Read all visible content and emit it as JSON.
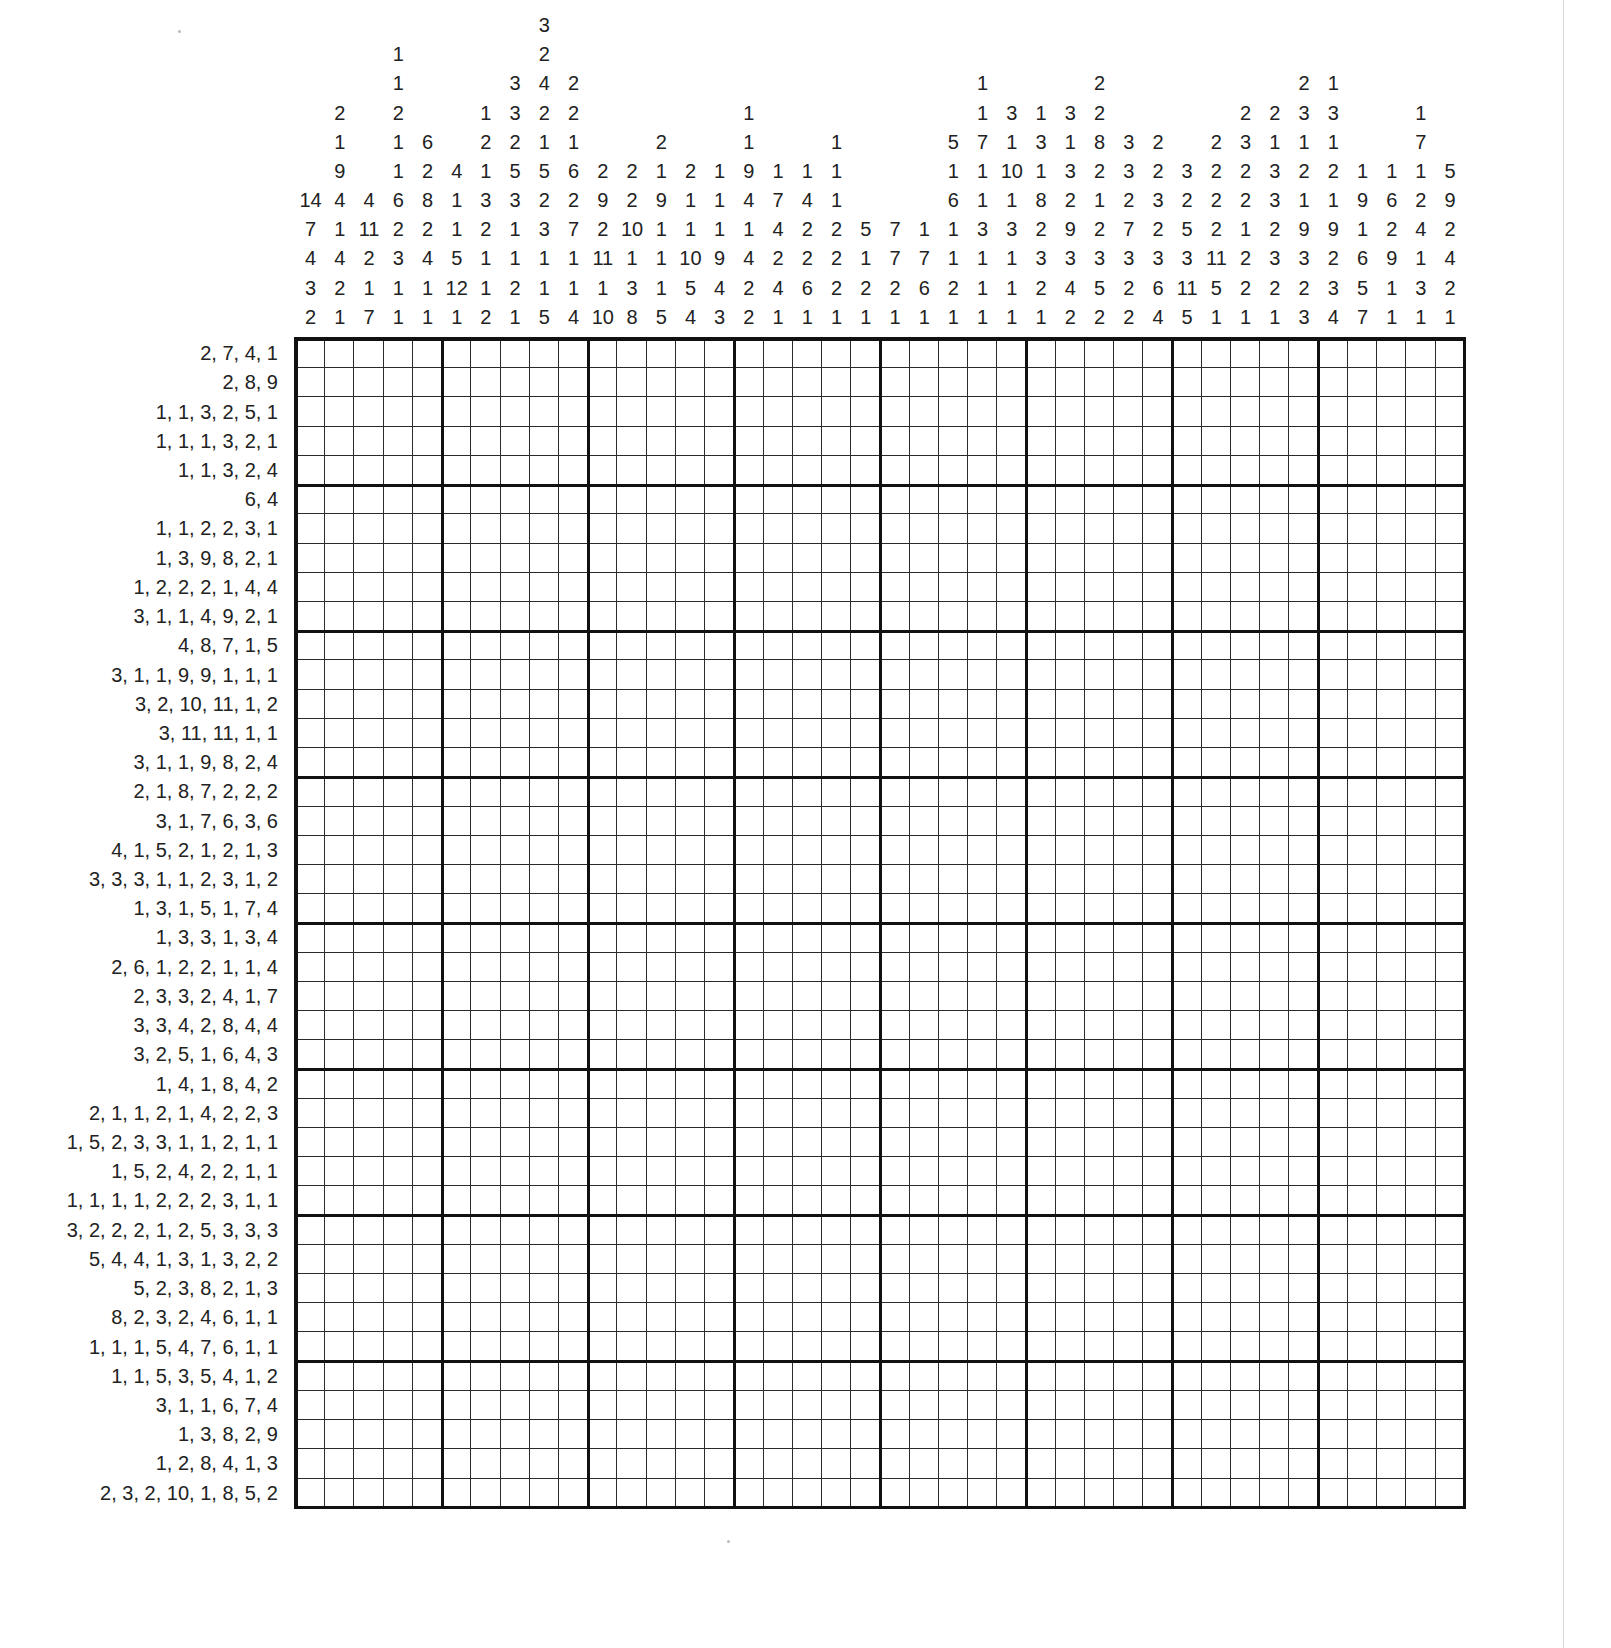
{
  "puzzle": {
    "type": "nonogram",
    "grid_width": 40,
    "grid_height": 40,
    "block_size": 5,
    "grid_color": "#2b2b2b",
    "thick_line_color": "#111111",
    "background_color": "#ffffff",
    "text_color": "#222222"
  },
  "column_clues": [
    [
      14,
      7,
      4,
      3,
      2
    ],
    [
      2,
      1,
      9,
      4,
      1,
      4,
      2,
      1
    ],
    [
      4,
      11,
      2,
      1,
      7
    ],
    [
      1,
      1,
      2,
      1,
      1,
      6,
      2,
      3,
      1,
      1
    ],
    [
      6,
      2,
      8,
      2,
      4,
      1,
      1
    ],
    [
      4,
      1,
      1,
      5,
      12,
      1
    ],
    [
      1,
      2,
      1,
      3,
      2,
      1,
      1,
      2
    ],
    [
      3,
      3,
      2,
      5,
      3,
      1,
      1,
      2,
      1
    ],
    [
      3,
      2,
      4,
      2,
      1,
      5,
      2,
      3,
      1,
      1,
      5
    ],
    [
      2,
      2,
      1,
      6,
      2,
      7,
      1,
      1,
      4
    ],
    [
      2,
      9,
      2,
      11,
      1,
      10
    ],
    [
      2,
      2,
      10,
      1,
      3,
      8
    ],
    [
      2,
      1,
      9,
      1,
      1,
      1,
      5
    ],
    [
      2,
      1,
      1,
      10,
      5,
      4
    ],
    [
      1,
      1,
      1,
      9,
      4,
      3
    ],
    [
      1,
      1,
      9,
      4,
      1,
      4,
      2,
      2
    ],
    [
      1,
      7,
      4,
      2,
      4,
      1
    ],
    [
      1,
      4,
      2,
      2,
      6,
      1
    ],
    [
      1,
      1,
      1,
      2,
      2,
      2,
      1
    ],
    [
      5,
      1,
      2,
      1
    ],
    [
      7,
      7,
      2,
      1
    ],
    [
      1,
      7,
      6,
      1
    ],
    [
      5,
      1,
      6,
      1,
      1,
      2,
      1
    ],
    [
      1,
      1,
      7,
      1,
      1,
      3,
      1,
      1,
      1
    ],
    [
      3,
      1,
      10,
      1,
      3,
      1,
      1,
      1
    ],
    [
      1,
      3,
      1,
      8,
      2,
      3,
      2,
      1
    ],
    [
      3,
      1,
      3,
      2,
      9,
      3,
      4,
      2
    ],
    [
      2,
      2,
      8,
      2,
      1,
      2,
      3,
      5,
      2
    ],
    [
      3,
      3,
      2,
      7,
      3,
      2,
      2
    ],
    [
      2,
      2,
      3,
      2,
      3,
      6,
      4
    ],
    [
      3,
      2,
      5,
      3,
      11,
      5
    ],
    [
      2,
      2,
      2,
      2,
      11,
      5,
      1
    ],
    [
      2,
      3,
      2,
      2,
      1,
      2,
      2,
      1
    ],
    [
      2,
      1,
      3,
      3,
      2,
      3,
      2,
      1
    ],
    [
      2,
      3,
      1,
      2,
      1,
      9,
      3,
      2,
      3
    ],
    [
      1,
      3,
      1,
      2,
      1,
      9,
      2,
      3,
      4
    ],
    [
      1,
      9,
      1,
      6,
      5,
      7
    ],
    [
      1,
      6,
      2,
      9,
      1,
      1
    ],
    [
      1,
      7,
      1,
      2,
      4,
      1,
      3,
      1
    ],
    [
      5,
      9,
      2,
      4,
      2,
      1
    ]
  ],
  "row_clues": [
    "2, 7, 4, 1",
    "2, 8, 9",
    "1, 1, 3, 2, 5, 1",
    "1, 1, 1, 3, 2, 1",
    "1, 1, 3, 2, 4",
    "6, 4",
    "1, 1, 2, 2, 3, 1",
    "1, 3, 9, 8, 2, 1",
    "1, 2, 2, 2, 1, 4, 4",
    "3, 1, 1, 4, 9, 2, 1",
    "4, 8, 7, 1, 5",
    "3, 1, 1, 9, 9, 1, 1, 1",
    "3, 2, 10, 11, 1, 2",
    "3, 11, 11, 1, 1",
    "3, 1, 1, 9, 8, 2, 4",
    "2, 1, 8, 7, 2, 2, 2",
    "3, 1, 7, 6, 3, 6",
    "4, 1, 5, 2, 1, 2, 1, 3",
    "3, 3, 3, 1, 1, 2, 3, 1, 2",
    "1, 3, 1, 5, 1, 7, 4",
    "1, 3, 3, 1, 3, 4",
    "2, 6, 1, 2, 2, 1, 1, 4",
    "2, 3, 3, 2, 4, 1, 7",
    "3, 3, 4, 2, 8, 4, 4",
    "3, 2, 5, 1, 6, 4, 3",
    "1, 4, 1, 8, 4, 2",
    "2, 1, 1, 2, 1, 4, 2, 2, 3",
    "1, 5, 2, 3, 3, 1, 1, 2, 1, 1",
    "1, 5, 2, 4, 2, 2, 1, 1",
    "1, 1, 1, 1, 2, 2, 2, 3, 1, 1",
    "3, 2, 2, 2, 1, 2, 5, 3, 3, 3",
    "5, 4, 4, 1, 3, 1, 3, 2, 2",
    "5, 2, 3, 8, 2, 1, 3",
    "8, 2, 3, 2, 4, 6, 1, 1",
    "1, 1, 1, 5, 4, 7, 6, 1, 1",
    "1, 1, 5, 3, 5, 4, 1, 2",
    "3, 1, 1, 6, 7, 4",
    "1, 3, 8, 2, 9",
    "1, 2, 8, 4, 1, 3",
    "2, 3, 2, 10, 1, 8, 5, 2"
  ]
}
